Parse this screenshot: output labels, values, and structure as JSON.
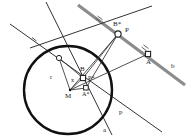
{
  "figure": {
    "type": "geometry-construction",
    "background_color": "#ffffff",
    "stroke_color": "#1a1a1a",
    "thin_line_color": "#444444",
    "highlight_line_color": "#8c8c8c"
  },
  "circle": {
    "name": "main-circle",
    "center_label": "M",
    "center": {
      "x": 68,
      "y": 90
    },
    "radius": 44,
    "stroke_width": 2.4,
    "color": "#111111"
  },
  "points": [
    {
      "id": "M",
      "label": "M",
      "x": 70,
      "y": 90,
      "marker": "dot",
      "label_dx": -5,
      "label_dy": 8
    },
    {
      "id": "P",
      "label": "P",
      "x": 118,
      "y": 34,
      "marker": "circle",
      "label_dx": 7,
      "label_dy": -2
    },
    {
      "id": "Bs",
      "label": "B*",
      "x": 118,
      "y": 34,
      "marker": "none",
      "label_dx": -3,
      "label_dy": -7
    },
    {
      "id": "A",
      "label": "A",
      "x": 148,
      "y": 54,
      "marker": "square",
      "label_dx": -1,
      "label_dy": 9
    },
    {
      "id": "Ps",
      "label": "P*",
      "x": 83,
      "y": 78,
      "marker": "square",
      "label_dx": 5,
      "label_dy": 2
    },
    {
      "id": "B",
      "label": "B",
      "x": 83,
      "y": 78,
      "marker": "none",
      "label_dx": -3,
      "label_dy": -7
    },
    {
      "id": "As",
      "label": "A*",
      "x": 86,
      "y": 88,
      "marker": "square",
      "label_dx": -1,
      "label_dy": 8
    },
    {
      "id": "T",
      "label": "",
      "x": 59,
      "y": 58,
      "marker": "circle",
      "label_dx": 0,
      "label_dy": 0
    }
  ],
  "segment_labels": [
    {
      "id": "r",
      "label": "r",
      "x": 50,
      "y": 77
    },
    {
      "id": "x",
      "label": "x",
      "x": 72,
      "y": 80
    }
  ],
  "line_labels": [
    {
      "id": "line-a",
      "label": "a",
      "x": 104,
      "y": 130
    },
    {
      "id": "line-b",
      "label": "b",
      "x": 172,
      "y": 66
    },
    {
      "id": "line-p",
      "label": "p",
      "x": 120,
      "y": 112
    }
  ],
  "lines": [
    {
      "id": "line-b-ray",
      "name": "line-b",
      "x1": 78,
      "y1": 5,
      "x2": 185,
      "y2": 85,
      "width": 3.0,
      "color": "#8c8c8c",
      "tick": 2
    },
    {
      "id": "line-p-ray",
      "name": "line-p",
      "x1": 10,
      "y1": 24,
      "x2": 162,
      "y2": 132,
      "width": 1.0,
      "color": "#333333",
      "tick": 1
    },
    {
      "id": "line-a-ray",
      "name": "line-a",
      "x1": 46,
      "y1": 2,
      "x2": 112,
      "y2": 135,
      "width": 1.0,
      "color": "#333333",
      "tick": 0
    },
    {
      "id": "line-tangent",
      "name": "tangent-line",
      "x1": 30,
      "y1": 48,
      "x2": 152,
      "y2": 6,
      "width": 1.0,
      "color": "#333333",
      "tick": 0
    }
  ],
  "connectors": [
    {
      "id": "c-M-T",
      "from": "M",
      "to": "T"
    },
    {
      "id": "c-M-P",
      "from": "M",
      "to": "P"
    },
    {
      "id": "c-M-A",
      "from": "M",
      "to": "A"
    },
    {
      "id": "c-T-Ps",
      "from": "T",
      "to": "Ps"
    },
    {
      "id": "c-P-Ps",
      "from": "P",
      "to": "Ps"
    },
    {
      "id": "c-P-As",
      "from": "P",
      "to": "As"
    },
    {
      "id": "c-M-Ps",
      "from": "M",
      "to": "Ps"
    },
    {
      "id": "c-M-As",
      "from": "M",
      "to": "As"
    }
  ]
}
